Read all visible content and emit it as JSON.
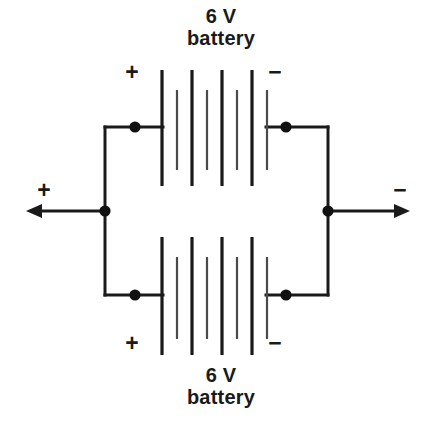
{
  "diagram": {
    "background_color": "#ffffff",
    "line_color": "#1a1a1a",
    "batteries": [
      {
        "id": "top-battery",
        "voltage_label": "6 V",
        "name_label": "battery",
        "caption": "6 V\nbattery",
        "positive_sign": "+",
        "negative_sign": "−",
        "positive_side": "left",
        "negative_side": "right",
        "cell_count": 4,
        "plate_x_positions": [
          162,
          177,
          192,
          207,
          222,
          237,
          252,
          267
        ],
        "long_plate_y": [
          70,
          186
        ],
        "short_plate_y": [
          90,
          170
        ]
      },
      {
        "id": "bottom-battery",
        "voltage_label": "6 V",
        "name_label": "battery",
        "caption": "6 V\nbattery",
        "positive_sign": "+",
        "negative_sign": "−",
        "positive_side": "left",
        "negative_side": "right",
        "cell_count": 4,
        "plate_x_positions": [
          162,
          177,
          192,
          207,
          222,
          237,
          252,
          267
        ],
        "long_plate_y": [
          237,
          355
        ],
        "short_plate_y": [
          257,
          339
        ]
      }
    ],
    "terminals": [
      {
        "id": "left-terminal",
        "sign": "+",
        "polarity": "positive",
        "direction": "left",
        "node_x": 105,
        "node_y": 211,
        "tip_x": 26
      },
      {
        "id": "right-terminal",
        "sign": "−",
        "polarity": "negative",
        "direction": "right",
        "node_x": 328,
        "node_y": 211,
        "tip_x": 410
      }
    ],
    "nodes": [
      {
        "id": "node-top-left",
        "x": 135,
        "y": 127
      },
      {
        "id": "node-top-right",
        "x": 286,
        "y": 127
      },
      {
        "id": "node-bottom-left",
        "x": 135,
        "y": 295
      },
      {
        "id": "node-bottom-right",
        "x": 286,
        "y": 295
      },
      {
        "id": "node-left-bus",
        "x": 105,
        "y": 211
      },
      {
        "id": "node-right-bus",
        "x": 328,
        "y": 211
      }
    ]
  }
}
